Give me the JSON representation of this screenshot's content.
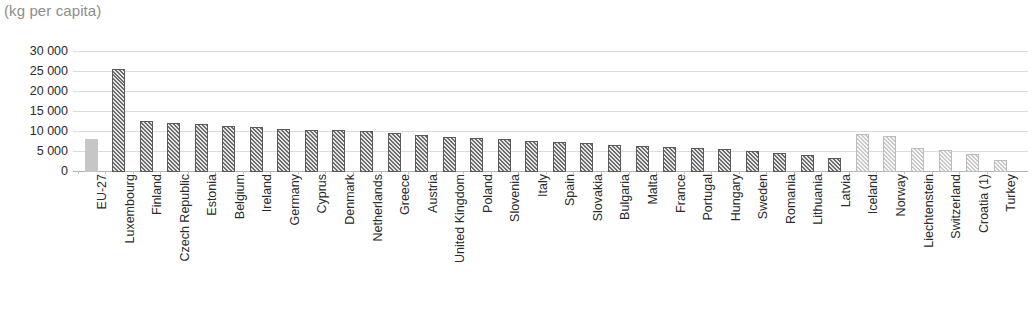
{
  "chart_data": {
    "type": "bar",
    "title": "(kg per capita)",
    "xlabel": "",
    "ylabel": "",
    "ylim": [
      0,
      30000
    ],
    "yticks": [
      0,
      5000,
      10000,
      15000,
      20000,
      25000,
      30000
    ],
    "ytick_labels": [
      "0",
      "5 000",
      "10 000",
      "15 000",
      "20 000",
      "25 000",
      "30 000"
    ],
    "grid": true,
    "legend": false,
    "categories": [
      "EU-27",
      "Luxembourg",
      "Finland",
      "Czech Republic",
      "Estonia",
      "Belgium",
      "Ireland",
      "Germany",
      "Cyprus",
      "Denmark",
      "Netherlands",
      "Greece",
      "Austria",
      "United Kingdom",
      "Poland",
      "Slovenia",
      "Italy",
      "Spain",
      "Slovakia",
      "Bulgaria",
      "Malta",
      "France",
      "Portugal",
      "Hungary",
      "Sweden",
      "Romania",
      "Lithuania",
      "Latvia",
      "Iceland",
      "Norway",
      "Liechtenstein",
      "Switzerland",
      "Croatia (1)",
      "Turkey"
    ],
    "values": [
      8300,
      25800,
      12800,
      12300,
      11900,
      11400,
      11200,
      10700,
      10500,
      10400,
      10300,
      9800,
      9300,
      8700,
      8400,
      8200,
      7800,
      7500,
      7200,
      6800,
      6500,
      6300,
      6000,
      5800,
      5300,
      4700,
      4200,
      3600,
      9400,
      9100,
      6100,
      5600,
      4400,
      3000
    ],
    "styles": [
      "solid-light",
      "hatch-dark",
      "hatch-dark",
      "hatch-dark",
      "hatch-dark",
      "hatch-dark",
      "hatch-dark",
      "hatch-dark",
      "hatch-dark",
      "hatch-dark",
      "hatch-dark",
      "hatch-dark",
      "hatch-dark",
      "hatch-dark",
      "hatch-dark",
      "hatch-dark",
      "hatch-dark",
      "hatch-dark",
      "hatch-dark",
      "hatch-dark",
      "hatch-dark",
      "hatch-dark",
      "hatch-dark",
      "hatch-dark",
      "hatch-dark",
      "hatch-dark",
      "hatch-dark",
      "hatch-dark",
      "hatch-light",
      "hatch-light",
      "hatch-light",
      "hatch-light",
      "hatch-light",
      "hatch-light"
    ],
    "colors": {
      "eu_aggregate": "#c6c6c6",
      "member_states": "#6e6e6e",
      "non_members": "#c9c9c9",
      "gridline": "#dcdcdc",
      "axis": "#b4b4b4",
      "title_text": "#8d8d8d",
      "tick_text": "#2b2b2b"
    }
  }
}
